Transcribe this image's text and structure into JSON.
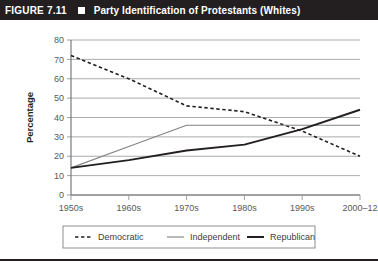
{
  "header": {
    "figure_number": "FIGURE 7.11",
    "marker_icon": "filled-square-icon",
    "title": "Party Identification of Protestants (Whites)"
  },
  "chart_data": {
    "type": "line",
    "title": "Party Identification of Protestants (Whites)",
    "xlabel": "",
    "ylabel": "Percentage",
    "categories": [
      "1950s",
      "1960s",
      "1970s",
      "1980s",
      "1990s",
      "2000–12"
    ],
    "ylim": [
      0,
      80
    ],
    "ytick_step": 10,
    "yticks": [
      "0",
      "10",
      "20",
      "30",
      "40",
      "50",
      "60",
      "70",
      "80"
    ],
    "grid": "horizontal",
    "legend_position": "bottom",
    "series": [
      {
        "name": "Democratic",
        "style": "dashed",
        "color": "#231f20",
        "width": 1.6,
        "values": [
          72,
          60,
          46,
          43,
          33,
          20
        ]
      },
      {
        "name": "Independent",
        "style": "solid-thin",
        "color": "#808285",
        "width": 1.1,
        "values": [
          14,
          25,
          36,
          36,
          36,
          36
        ]
      },
      {
        "name": "Republican",
        "style": "solid-thick",
        "color": "#231f20",
        "width": 2.0,
        "values": [
          14,
          18,
          23,
          26,
          34,
          44
        ]
      }
    ]
  },
  "legend": {
    "items": [
      {
        "label": "Democratic",
        "swatch": "dashed-line-swatch"
      },
      {
        "label": "Independent",
        "swatch": "thin-line-swatch"
      },
      {
        "label": "Republican",
        "swatch": "thick-line-swatch"
      }
    ]
  }
}
